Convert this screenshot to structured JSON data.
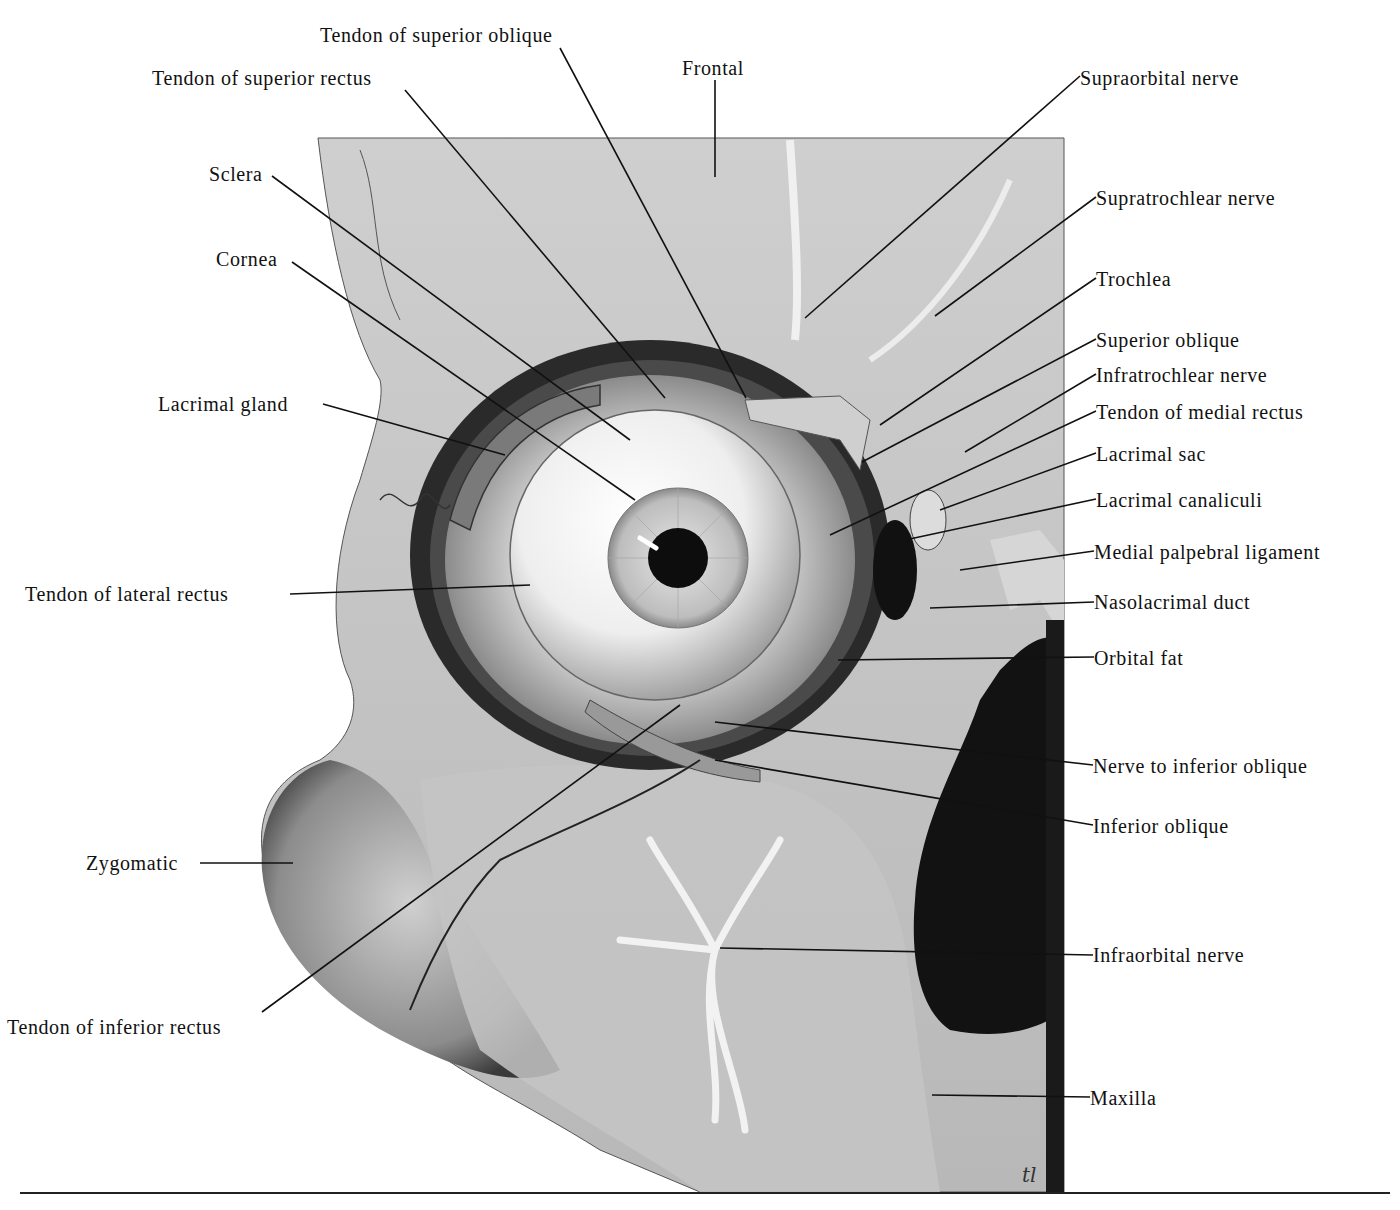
{
  "figure": {
    "signature": "tl",
    "colors": {
      "background": "#ffffff",
      "bone_light": "#dcdcdc",
      "bone_mid": "#b8b8b8",
      "shadow": "#1c1c1c",
      "line": "#111111"
    }
  },
  "labels": {
    "left": [
      {
        "id": "tendon-superior-oblique",
        "text": "Tendon of superior oblique",
        "x": 320,
        "y": 24,
        "lx": 560,
        "ly": 48,
        "tx": 746,
        "ty": 398
      },
      {
        "id": "tendon-superior-rectus",
        "text": "Tendon of superior rectus",
        "x": 152,
        "y": 67,
        "lx": 405,
        "ly": 90,
        "tx": 665,
        "ty": 398
      },
      {
        "id": "sclera",
        "text": "Sclera",
        "x": 209,
        "y": 163,
        "lx": 272,
        "ly": 176,
        "tx": 630,
        "ty": 440
      },
      {
        "id": "cornea",
        "text": "Cornea",
        "x": 216,
        "y": 248,
        "lx": 292,
        "ly": 262,
        "tx": 635,
        "ty": 500
      },
      {
        "id": "lacrimal-gland",
        "text": "Lacrimal gland",
        "x": 158,
        "y": 393,
        "lx": 323,
        "ly": 404,
        "tx": 505,
        "ty": 455
      },
      {
        "id": "tendon-lateral-rectus",
        "text": "Tendon of lateral rectus",
        "x": 25,
        "y": 583,
        "lx": 290,
        "ly": 594,
        "tx": 530,
        "ty": 585
      },
      {
        "id": "zygomatic",
        "text": "Zygomatic",
        "x": 86,
        "y": 852,
        "lx": 200,
        "ly": 863,
        "tx": 293,
        "ty": 863
      },
      {
        "id": "tendon-inferior-rectus",
        "text": "Tendon of inferior rectus",
        "x": 7,
        "y": 1016,
        "lx": 262,
        "ly": 1012,
        "tx": 680,
        "ty": 705
      }
    ],
    "top": [
      {
        "id": "frontal",
        "text": "Frontal",
        "x": 682,
        "y": 57,
        "lx": 715,
        "ly": 80,
        "tx": 715,
        "ty": 177
      }
    ],
    "right": [
      {
        "id": "supraorbital-nerve",
        "text": "Supraorbital nerve",
        "x": 1080,
        "y": 67,
        "lx": 1080,
        "ly": 76,
        "tx": 805,
        "ty": 318
      },
      {
        "id": "supratrochlear-nerve",
        "text": "Supratrochlear nerve",
        "x": 1096,
        "y": 187,
        "lx": 1096,
        "ly": 197,
        "tx": 935,
        "ty": 316
      },
      {
        "id": "trochlea",
        "text": "Trochlea",
        "x": 1096,
        "y": 268,
        "lx": 1096,
        "ly": 278,
        "tx": 880,
        "ty": 425
      },
      {
        "id": "superior-oblique",
        "text": "Superior oblique",
        "x": 1096,
        "y": 329,
        "lx": 1096,
        "ly": 339,
        "tx": 862,
        "ty": 462
      },
      {
        "id": "infratrochlear-nerve",
        "text": "Infratrochlear nerve",
        "x": 1096,
        "y": 364,
        "lx": 1096,
        "ly": 374,
        "tx": 965,
        "ty": 452
      },
      {
        "id": "tendon-medial-rectus",
        "text": "Tendon of medial rectus",
        "x": 1096,
        "y": 401,
        "lx": 1096,
        "ly": 411,
        "tx": 830,
        "ty": 535
      },
      {
        "id": "lacrimal-sac",
        "text": "Lacrimal sac",
        "x": 1096,
        "y": 443,
        "lx": 1096,
        "ly": 453,
        "tx": 940,
        "ty": 510
      },
      {
        "id": "lacrimal-canaliculi",
        "text": "Lacrimal canaliculi",
        "x": 1096,
        "y": 489,
        "lx": 1096,
        "ly": 499,
        "tx": 905,
        "ty": 540
      },
      {
        "id": "medial-palpebral-ligament",
        "text": "Medial palpebral ligament",
        "x": 1094,
        "y": 541,
        "lx": 1094,
        "ly": 551,
        "tx": 960,
        "ty": 570
      },
      {
        "id": "nasolacrimal-duct",
        "text": "Nasolacrimal duct",
        "x": 1094,
        "y": 591,
        "lx": 1094,
        "ly": 602,
        "tx": 930,
        "ty": 608
      },
      {
        "id": "orbital-fat",
        "text": "Orbital fat",
        "x": 1094,
        "y": 647,
        "lx": 1094,
        "ly": 657,
        "tx": 838,
        "ty": 660
      },
      {
        "id": "nerve-inferior-oblique",
        "text": "Nerve to inferior oblique",
        "x": 1093,
        "y": 755,
        "lx": 1093,
        "ly": 765,
        "tx": 715,
        "ty": 722
      },
      {
        "id": "inferior-oblique",
        "text": "Inferior oblique",
        "x": 1093,
        "y": 815,
        "lx": 1093,
        "ly": 825,
        "tx": 715,
        "ty": 760
      },
      {
        "id": "infraorbital-nerve",
        "text": "Infraorbital nerve",
        "x": 1093,
        "y": 944,
        "lx": 1093,
        "ly": 955,
        "tx": 720,
        "ty": 948
      },
      {
        "id": "maxilla",
        "text": "Maxilla",
        "x": 1090,
        "y": 1087,
        "lx": 1090,
        "ly": 1097,
        "tx": 932,
        "ty": 1095
      }
    ]
  }
}
